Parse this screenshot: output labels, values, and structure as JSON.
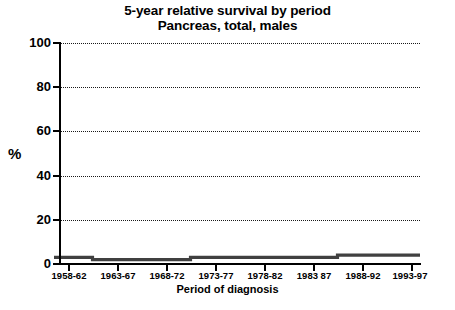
{
  "chart_data": {
    "type": "line",
    "title": "5-year relative survival by period",
    "subtitle": "Pancreas, total, males",
    "xlabel": "Period of diagnosis",
    "ylabel": "%",
    "categories": [
      "1958-62",
      "1963-67",
      "1968-72",
      "1973-77",
      "1978-82",
      "1983 87",
      "1988-92",
      "1993-97"
    ],
    "values": [
      3,
      2,
      2,
      3,
      3,
      3,
      4,
      4
    ],
    "series": [
      {
        "name": "Pancreas, total, males",
        "values": [
          3,
          2,
          2,
          3,
          3,
          3,
          4,
          4
        ]
      }
    ],
    "yticks": [
      "0",
      "20",
      "40",
      "60",
      "80",
      "100"
    ],
    "ytick_values": [
      0,
      20,
      40,
      60,
      80,
      100
    ],
    "ylim": [
      0,
      100
    ],
    "grid": "horizontal-dotted",
    "legend": "none",
    "line_style": "step",
    "line_color": "#404040",
    "axis_color": "#000000",
    "grid_color": "#1a1a1a",
    "background": "#ffffff"
  },
  "axis": {
    "y_title": "%",
    "x_title": "Period of diagnosis"
  }
}
